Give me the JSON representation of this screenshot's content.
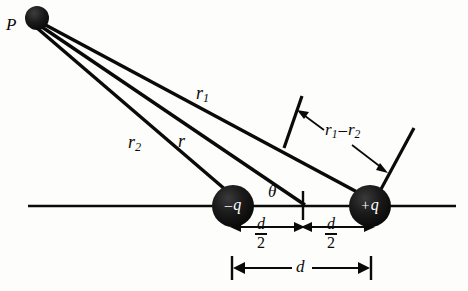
{
  "figure": {
    "background_color": "#fdfdfb",
    "stroke_color": "#0a0a0a",
    "charge_fill_color": "#141414",
    "label_color": "#0a0a0a",
    "charge_label_color": "#ffffff"
  },
  "points": {
    "field_point_label": "P",
    "field_point": {
      "x": 37,
      "y": 18,
      "radius": 12
    },
    "negative_charge": {
      "x": 233,
      "y": 206,
      "radius": 21
    },
    "positive_charge": {
      "x": 370,
      "y": 206,
      "radius": 21
    },
    "midpoint": {
      "x": 303,
      "y": 206
    }
  },
  "charges": {
    "negative_sign": "–",
    "negative_symbol": "q",
    "positive_sign": "+",
    "positive_symbol": "q"
  },
  "distances": {
    "r1_label": "r",
    "r1_subscript": "1",
    "r2_label": "r",
    "r2_subscript": "2",
    "r_label": "r",
    "difference_label": "r",
    "difference_sub1": "1",
    "difference_operator": "–",
    "difference_label2": "r",
    "difference_sub2": "2"
  },
  "angle": {
    "label": "θ"
  },
  "dimensions": {
    "half_separation_numerator": "d",
    "half_separation_denominator": "2",
    "full_separation_label": "d"
  },
  "axis": {
    "left_x": 28,
    "right_x": 456,
    "y": 206
  }
}
